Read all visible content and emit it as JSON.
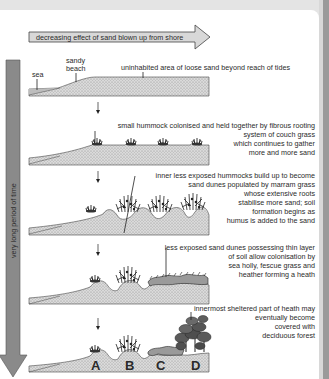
{
  "title_arrow": {
    "label": "decreasing effect of sand blown up from shore"
  },
  "time_arrow": {
    "label": "very long period of time"
  },
  "colors": {
    "sand_fill": "#d2d2d2",
    "arrow_fill": "#8a8a8a",
    "header_arrow_fill": "#d8d8d8",
    "forest_fill": "#555555",
    "text": "#2a2a2a"
  },
  "stages": [
    {
      "id": "stage-1",
      "labels": {
        "sea": "sea",
        "sandy_beach_line1": "sandy",
        "sandy_beach_line2": "beach",
        "loose_sand": "uninhabited area of loose sand beyond reach of tides"
      }
    },
    {
      "id": "stage-2",
      "description": [
        "small hummock colonised and held together by fibrous rooting",
        "system of couch grass",
        "which continues to gather",
        "more and more sand"
      ]
    },
    {
      "id": "stage-3",
      "description": [
        "inner less exposed hummocks build up to become",
        "sand dunes populated by marram grass",
        "whose extensive roots",
        "stabilise more sand; soil",
        "formation begins as",
        "humus is added to the sand"
      ]
    },
    {
      "id": "stage-4",
      "description": [
        "less exposed sand dunes possessing thin layer",
        "of soil allow colonisation by",
        "sea holly, fescue grass and",
        "heather forming a heath"
      ]
    },
    {
      "id": "stage-5",
      "description": [
        "innermost sheltered part of heath may",
        "eventually become",
        "covered with",
        "deciduous forest"
      ],
      "zones": [
        "A",
        "B",
        "C",
        "D"
      ]
    }
  ]
}
